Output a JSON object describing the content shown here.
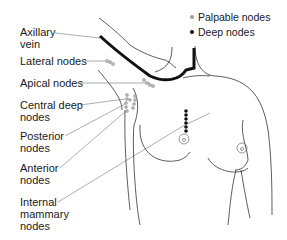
{
  "diagram": {
    "legend": [
      {
        "label": "Palpable nodes",
        "color": "#9a9a9a"
      },
      {
        "label": "Deep nodes",
        "color": "#111111"
      }
    ],
    "labels": [
      {
        "id": "axillary-vein",
        "text": "Axillary\nvein"
      },
      {
        "id": "lateral-nodes",
        "text": "Lateral nodes"
      },
      {
        "id": "apical-nodes",
        "text": "Apical nodes"
      },
      {
        "id": "central-deep-nodes",
        "text": "Central deep\nnodes"
      },
      {
        "id": "posterior-nodes",
        "text": "Posterior\nnodes"
      },
      {
        "id": "anterior-nodes",
        "text": "Anterior\nnodes"
      },
      {
        "id": "internal-mammary-nodes",
        "text": "Internal\nmammary\nnodes"
      }
    ]
  }
}
